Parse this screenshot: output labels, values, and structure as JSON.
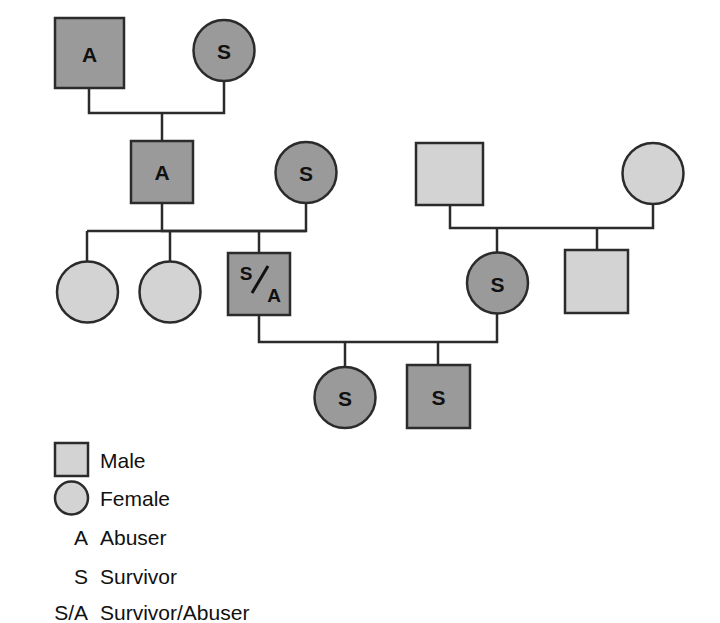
{
  "figure": {
    "type": "genogram"
  },
  "colors": {
    "dark_fill": "#9a9a9a",
    "light_fill": "#d3d3d3",
    "stroke": "#2b2b2b",
    "text": "#111111",
    "background": "#ffffff"
  },
  "nodes": [
    {
      "id": "g1-male",
      "shape": "square",
      "label": "A",
      "fill": "dark",
      "sex": "Male",
      "role": "Abuser"
    },
    {
      "id": "g1-female",
      "shape": "circle",
      "label": "S",
      "fill": "dark",
      "sex": "Female",
      "role": "Survivor"
    },
    {
      "id": "g2-male-a",
      "shape": "square",
      "label": "A",
      "fill": "dark",
      "sex": "Male",
      "role": "Abuser"
    },
    {
      "id": "g2-female-s",
      "shape": "circle",
      "label": "S",
      "fill": "dark",
      "sex": "Female",
      "role": "Survivor"
    },
    {
      "id": "g2-male-right",
      "shape": "square",
      "label": "",
      "fill": "light",
      "sex": "Male",
      "role": ""
    },
    {
      "id": "g2-female-right",
      "shape": "circle",
      "label": "",
      "fill": "light",
      "sex": "Female",
      "role": ""
    },
    {
      "id": "g3-female-1",
      "shape": "circle",
      "label": "",
      "fill": "light",
      "sex": "Female",
      "role": ""
    },
    {
      "id": "g3-female-2",
      "shape": "circle",
      "label": "",
      "fill": "light",
      "sex": "Female",
      "role": ""
    },
    {
      "id": "g3-male-sa",
      "shape": "square",
      "label": "S/A",
      "fill": "dark",
      "sex": "Male",
      "role": "Survivor/Abuser"
    },
    {
      "id": "g3-female-s",
      "shape": "circle",
      "label": "S",
      "fill": "dark",
      "sex": "Female",
      "role": "Survivor"
    },
    {
      "id": "g3-male-right",
      "shape": "square",
      "label": "",
      "fill": "light",
      "sex": "Male",
      "role": ""
    },
    {
      "id": "g4-female-s",
      "shape": "circle",
      "label": "S",
      "fill": "dark",
      "sex": "Female",
      "role": "Survivor"
    },
    {
      "id": "g4-male-s",
      "shape": "square",
      "label": "S",
      "fill": "dark",
      "sex": "Male",
      "role": "Survivor"
    }
  ],
  "labels": {
    "g1_male": "A",
    "g1_female": "S",
    "g2_male_a": "A",
    "g2_female_s": "S",
    "g3_male_sa_top": "S",
    "g3_male_sa_bottom": "A",
    "g3_female_s": "S",
    "g4_female_s": "S",
    "g4_male_s": "S"
  },
  "legend": {
    "items": [
      {
        "key": "",
        "symbol": "square",
        "fill": "light",
        "label": "Male"
      },
      {
        "key": "",
        "symbol": "circle",
        "fill": "light",
        "label": "Female"
      },
      {
        "key": "A",
        "symbol": "text",
        "fill": "",
        "label": "Abuser"
      },
      {
        "key": "S",
        "symbol": "text",
        "fill": "",
        "label": "Survivor"
      },
      {
        "key": "S/A",
        "symbol": "text",
        "fill": "",
        "label": "Survivor/Abuser"
      }
    ]
  }
}
